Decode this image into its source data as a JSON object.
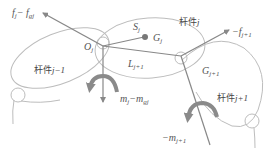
{
  "diagram": {
    "colors": {
      "link_outline": "#bdbdbd",
      "vector_line": "#888888",
      "moment_arrow": "#8a8a8a",
      "com_dot": "#777777",
      "text": "#555555"
    },
    "links": [
      {
        "name": "link-j-minus-1",
        "label_main": "杆件",
        "label_index": "j−1"
      },
      {
        "name": "link-j",
        "label_main": "杆件",
        "label_index": "j"
      },
      {
        "name": "link-j-plus-1",
        "label_main": "杆件",
        "label_index": "j+1"
      }
    ],
    "labels": {
      "force_left": {
        "base": "f",
        "sub": "j",
        "sep": "− ",
        "base2": "f",
        "sub2": "gj"
      },
      "force_right": {
        "base": "−f",
        "sub": "j+1"
      },
      "joint_O": {
        "base": "O",
        "sub": "j"
      },
      "vector_S": {
        "base": "S",
        "sub": "j"
      },
      "com_G": {
        "base": "G",
        "sub": "j"
      },
      "vector_L": {
        "base": "L",
        "sub": "j+1"
      },
      "joint_G_next": {
        "base": "G",
        "sub": "j+1"
      },
      "moment_center": {
        "base": "m",
        "sub": "j",
        "sep": "−",
        "base2": "m",
        "sub2": "gj"
      },
      "moment_right": {
        "base": "−m",
        "sub": "j+1"
      }
    }
  }
}
